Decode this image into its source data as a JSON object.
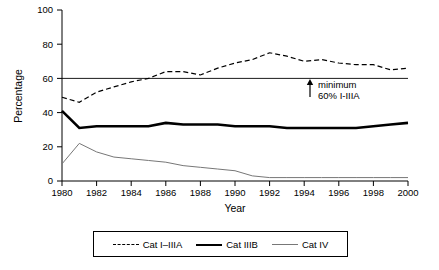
{
  "chart_data": {
    "type": "line",
    "title": "",
    "xlabel": "Year",
    "ylabel": "Percentage",
    "xlim": [
      1980,
      2000
    ],
    "ylim": [
      0,
      100
    ],
    "xticks": [
      1980,
      1982,
      1984,
      1986,
      1988,
      1990,
      1992,
      1994,
      1996,
      1998,
      2000
    ],
    "yticks": [
      0,
      20,
      40,
      60,
      80,
      100
    ],
    "grid": false,
    "legend_position": "bottom",
    "x": [
      1980,
      1981,
      1982,
      1983,
      1984,
      1985,
      1986,
      1987,
      1988,
      1989,
      1990,
      1991,
      1992,
      1993,
      1994,
      1995,
      1996,
      1997,
      1998,
      1999,
      2000
    ],
    "series": [
      {
        "name": "Cat I–IIIA",
        "style": "dashed",
        "color": "#000000",
        "values": [
          49,
          46,
          52,
          55,
          58,
          60,
          64,
          64,
          62,
          66,
          69,
          71,
          75,
          73,
          70,
          71,
          69,
          68,
          68,
          65,
          66
        ]
      },
      {
        "name": "Cat IIIB",
        "style": "thick-solid",
        "color": "#000000",
        "values": [
          41,
          31,
          32,
          32,
          32,
          32,
          34,
          33,
          33,
          33,
          32,
          32,
          32,
          31,
          31,
          31,
          31,
          31,
          32,
          33,
          34
        ]
      },
      {
        "name": "Cat IV",
        "style": "thin-solid",
        "color": "#777777",
        "values": [
          10,
          22,
          17,
          14,
          13,
          12,
          11,
          9,
          8,
          7,
          6,
          3,
          2,
          2,
          2,
          2,
          2,
          2,
          2,
          2,
          2
        ]
      }
    ],
    "reference_line": {
      "value": 60,
      "label_line1": "minimum",
      "label_line2": "60% I-IIIA",
      "arrow": "up-arrow-icon"
    }
  },
  "legend": {
    "items": [
      {
        "label": "Cat I–IIIA",
        "swatch": "dashed-line-icon"
      },
      {
        "label": "Cat IIIB",
        "swatch": "thick-line-icon"
      },
      {
        "label": "Cat IV",
        "swatch": "thin-line-icon"
      }
    ]
  }
}
